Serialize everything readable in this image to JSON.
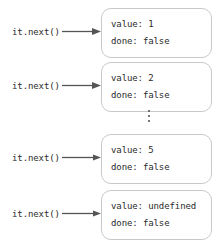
{
  "figure": {
    "colors": {
      "text": "#2b2b2b",
      "box_border": "#c9c9c9",
      "box_background": "#ffffff",
      "arrow": "#555555",
      "page_background": "#ffffff"
    },
    "ellipsis": {
      "symbol": "vertical-ellipsis",
      "meaning": "additional iterations omitted"
    },
    "rows": [
      {
        "call": "it.next()",
        "arrow": "right-arrow",
        "result": {
          "value_line": "value: 1",
          "done_line": "done: false"
        }
      },
      {
        "call": "it.next()",
        "arrow": "right-arrow",
        "result": {
          "value_line": "value: 2",
          "done_line": "done: false"
        }
      },
      {
        "call": "it.next()",
        "arrow": "right-arrow",
        "result": {
          "value_line": "value: 5",
          "done_line": "done: false"
        }
      },
      {
        "call": "it.next()",
        "arrow": "right-arrow",
        "result": {
          "value_line": "value: undefined",
          "done_line": "done: false"
        }
      }
    ]
  }
}
